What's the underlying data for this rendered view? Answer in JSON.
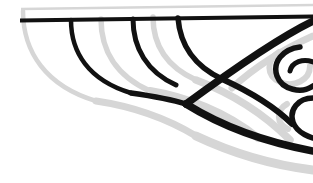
{
  "artwork": {
    "title": "Abstract Ornamental Line Flourish",
    "description": "Cropped decorative line-art composition of sweeping arcs and spiral curls rendered in black with offset light-gray shadow strokes, anchored to two horizontal rules near the top edge.",
    "width": 313,
    "height": 183
  },
  "canvas": {
    "background": "#ffffff",
    "width": 313,
    "height": 183
  },
  "palette": {
    "ink": "#111111",
    "shadow": "#d6d6d6",
    "background": "#ffffff"
  },
  "strokes": {
    "rules": [
      {
        "name": "upper-gray-rule",
        "color": "#d6d6d6",
        "width": 2.6,
        "path": "M 21 9 L 313 5"
      },
      {
        "name": "lower-black-rule",
        "color": "#111111",
        "width": 4.0,
        "path": "M 20 20.5 L 313 16.5"
      }
    ],
    "shadow_curves": [
      {
        "name": "shadow-arc-outer-left",
        "color": "#d6d6d6",
        "width": 4.5,
        "path": "M 23 11 C 23 52, 46 86, 96 101"
      },
      {
        "name": "shadow-arc-second",
        "color": "#d6d6d6",
        "width": 5.5,
        "path": "M 101 19 C 101 50, 116 76, 150 91"
      },
      {
        "name": "shadow-arc-third",
        "color": "#d6d6d6",
        "width": 5.5,
        "path": "M 153 17 C 153 44, 165 66, 196 80"
      },
      {
        "name": "shadow-sweep-lower-left",
        "color": "#d6d6d6",
        "width": 7.0,
        "path": "M 96 101 C 130 106, 166 118, 196 136"
      },
      {
        "name": "shadow-sweep-diagonal",
        "color": "#d6d6d6",
        "width": 8.0,
        "path": "M 150 91 C 186 97, 226 112, 258 138"
      },
      {
        "name": "shadow-sweep-bottom-long",
        "color": "#d6d6d6",
        "width": 9.0,
        "path": "M 196 136 C 232 153, 272 165, 313 170"
      },
      {
        "name": "shadow-sweep-bottom-inner",
        "color": "#d6d6d6",
        "width": 7.5,
        "path": "M 196 80 C 228 92, 262 112, 290 140"
      },
      {
        "name": "shadow-diagonal-upper-right",
        "color": "#d6d6d6",
        "width": 7.0,
        "path": "M 313 36 C 286 48, 256 66, 232 88"
      },
      {
        "name": "shadow-curl-upper",
        "color": "#d6d6d6",
        "width": 6.0,
        "path": "M 279 52 C 266 60, 266 76, 280 82 C 294 88, 310 80, 310 66"
      },
      {
        "name": "shadow-curl-lower",
        "color": "#d6d6d6",
        "width": 6.0,
        "path": "M 287 104 C 276 110, 276 124, 288 129"
      }
    ],
    "ink_curves": [
      {
        "name": "ink-arc-first",
        "color": "#111111",
        "width": 4.5,
        "path": "M 71 20 C 71 52, 88 80, 131 93"
      },
      {
        "name": "ink-arc-second",
        "color": "#111111",
        "width": 5.0,
        "path": "M 133 19 C 133 48, 147 72, 176 85"
      },
      {
        "name": "ink-arc-third",
        "color": "#111111",
        "width": 5.5,
        "path": "M 178 18 C 180 44, 194 66, 222 79"
      },
      {
        "name": "ink-join-lower-left",
        "color": "#111111",
        "width": 5.5,
        "path": "M 131 93 C 152 96, 170 99, 186 104"
      },
      {
        "name": "ink-diagonal-main",
        "color": "#111111",
        "width": 7.5,
        "path": "M 313 21 C 278 38, 232 70, 186 104"
      },
      {
        "name": "ink-sweep-bottom",
        "color": "#111111",
        "width": 7.5,
        "path": "M 186 104 C 215 122, 254 140, 313 151"
      },
      {
        "name": "ink-sweep-mid",
        "color": "#111111",
        "width": 6.0,
        "path": "M 222 79 C 246 90, 272 104, 292 124"
      },
      {
        "name": "ink-curl-upper",
        "color": "#111111",
        "width": 5.5,
        "path": "M 300 47 C 283 49, 272 62, 277 76 C 282 90, 302 94, 313 86"
      },
      {
        "name": "ink-curl-upper-tail",
        "color": "#111111",
        "width": 5.0,
        "path": "M 313 62 C 303 58, 292 62, 290 71"
      },
      {
        "name": "ink-curl-lower",
        "color": "#111111",
        "width": 5.5,
        "path": "M 313 98 C 298 98, 289 110, 293 122 C 297 134, 313 138, 313 138"
      }
    ]
  }
}
